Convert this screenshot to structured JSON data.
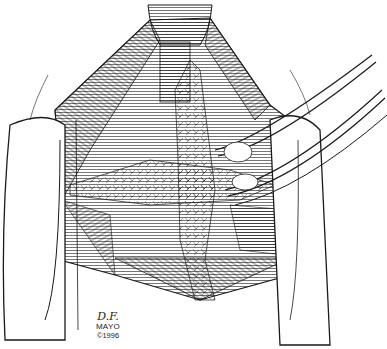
{
  "illustration": {
    "subject": "surgical-exposure-line-drawing",
    "ink_color": "#1a1a1a",
    "background": "#ffffff"
  },
  "signature": {
    "initials": "D.F.",
    "name": "MAYO",
    "year": "©1996"
  }
}
